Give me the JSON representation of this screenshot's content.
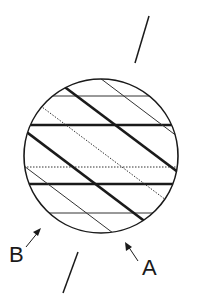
{
  "diagram": {
    "type": "crystal-cross-section",
    "labels": {
      "a": "A",
      "b": "B"
    },
    "colors": {
      "stroke": "#1a1a1a",
      "background": "#ffffff"
    },
    "circle": {
      "cx": 101,
      "cy": 156,
      "r": 77
    },
    "horizontal_lines": [
      {
        "y": 96,
        "style": "thin"
      },
      {
        "y": 125,
        "style": "thick"
      },
      {
        "y": 167,
        "style": "dotted"
      },
      {
        "y": 184,
        "style": "thick"
      },
      {
        "y": 213,
        "style": "thin"
      }
    ],
    "diagonal_lines": [
      {
        "style": "thin"
      },
      {
        "style": "thick"
      },
      {
        "style": "dotted"
      },
      {
        "style": "thick"
      },
      {
        "style": "thin"
      }
    ],
    "axis_lines": [
      {
        "position": "top"
      },
      {
        "position": "bottom"
      }
    ]
  }
}
